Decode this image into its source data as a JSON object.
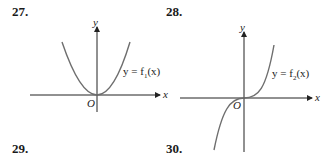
{
  "problems": [
    {
      "number": "27.",
      "function_label": "y = f",
      "subscript": "1",
      "arg": "(x)",
      "curve": "parabola"
    },
    {
      "number": "28.",
      "function_label": "y = f",
      "subscript": "2",
      "arg": "(x)",
      "curve": "cubic"
    },
    {
      "number": "29."
    },
    {
      "number": "30."
    }
  ],
  "axes": {
    "x_label": "x",
    "y_label": "y",
    "origin_label": "O"
  },
  "colors": {
    "axis": "#222222",
    "curve": "#6e6e6e",
    "text": "#1a1a1a"
  }
}
